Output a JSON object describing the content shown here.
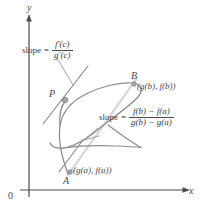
{
  "figure": {
    "type": "cauchy-mean-value-theorem-diagram",
    "axes": {
      "y_label": "y",
      "x_label": "x",
      "origin_label": "0"
    },
    "points": [
      {
        "id": "P",
        "label": "P",
        "coord_label": "",
        "x": 65,
        "y": 100
      },
      {
        "id": "B",
        "label": "B",
        "coord_label": "(g(b), f(b))",
        "x": 132,
        "y": 83
      },
      {
        "id": "A",
        "label": "A",
        "coord_label": "(g(a), f(a))",
        "x": 70,
        "y": 172
      }
    ],
    "tangent_formula": {
      "lhs": "slope",
      "equals": "=",
      "numerator": "f′(c)",
      "denominator": "g′(c)"
    },
    "secant_formula": {
      "lhs": "slope",
      "equals": "=",
      "numerator": "f(b) − f(a)",
      "denominator": "g(b) − g(a)"
    },
    "colors": {
      "axis": "#4a4a4a",
      "curve": "#7a7a7a",
      "tangent": "#8a8a8a",
      "secant": "#d0d0d0",
      "point": "#9a9a9a",
      "text": "#4a4a4a"
    }
  }
}
